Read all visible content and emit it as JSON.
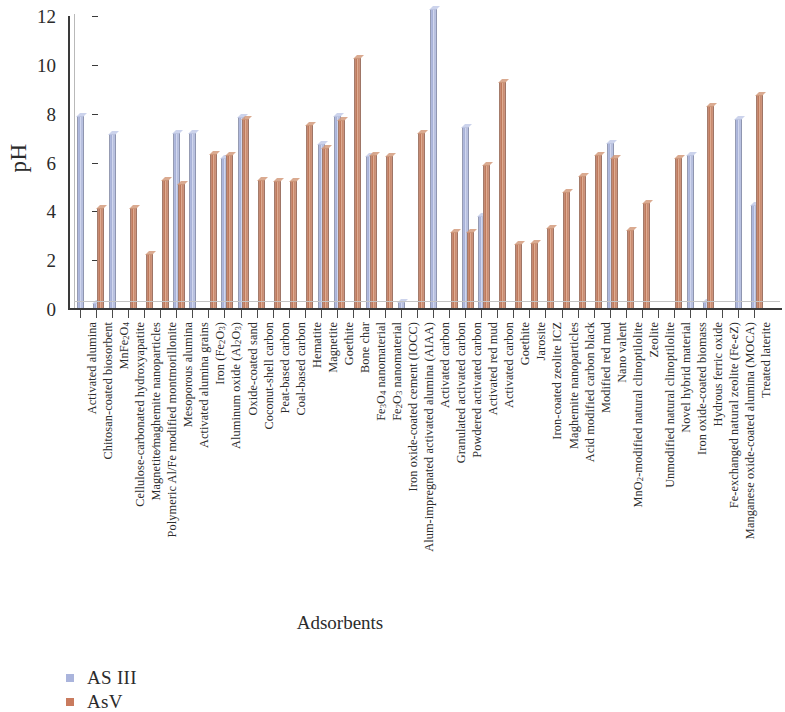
{
  "chart_data": {
    "type": "bar",
    "title": "",
    "xlabel": "Adsorbents",
    "ylabel": "pH",
    "ylim": [
      0,
      12
    ],
    "yticks": [
      0,
      2,
      4,
      6,
      8,
      10,
      12
    ],
    "grid": false,
    "legend_position": "bottom-left",
    "categories": [
      "Activated alumina",
      "Chitosan-coated biosorbent",
      "MnFe₂O₄",
      "Cellulose-carbonated hydroxyapatite",
      "Magnetite⁄maghemite nanoparticles",
      "Polymeric Al/Fe modified montmorillonite",
      "Mesoporous alumina",
      "Activated alumina grains",
      "Iron (Fe₂O₃)",
      "Aluminum oxide (Al₂O₃)",
      "Oxide-coated sand",
      "Coconut-shell carbon",
      "Peat-based carbon",
      "Coal-based carbon",
      "Hematite",
      "Magnetite",
      "Goethite",
      "Bone char",
      "Fe₃O₄ nanomaterial",
      "Fe₂O₃ nanomaterial",
      "Iron oxide-coated cement (IOCC)",
      "Alum-impregnated activated alumina (AIAA)",
      "Activated carbon",
      "Granulated activated carbon",
      "Powdered activated carbon",
      "Activated red mud",
      "Activated carbon",
      "Goethite",
      "Jarosite",
      "Iron-coated zeolite ICZ",
      "Maghemite nanoparticles",
      "Acid modified carbon black",
      "Modified red mud",
      "Nano valent",
      "MnO₂-modified natural clinoptilolite",
      "Zeolite",
      "Unmodified natural clinoptilolite",
      "Novel hybrid material",
      "Iron oxide-coated biomass",
      "Hydrous ferric oxide",
      "Fe-exchanged natural zeolite (Fe-eZ)",
      "Manganese oxide-coated alumina (MOCA)",
      "Treated laterite"
    ],
    "series": [
      {
        "name": "AS III",
        "color": "#aab4dc",
        "values": [
          7.9,
          0.25,
          7.15,
          0,
          0,
          0,
          7.2,
          7.2,
          0,
          6.2,
          7.85,
          0,
          0,
          0,
          0,
          6.75,
          7.9,
          0,
          6.25,
          0,
          0.3,
          0,
          12.3,
          0,
          7.45,
          3.8,
          0,
          0,
          0,
          0,
          0,
          0,
          0,
          6.8,
          0,
          0,
          0,
          0,
          6.3,
          0.3,
          0,
          7.8,
          4.25
        ]
      },
      {
        "name": "AsV",
        "color": "#c97b5e",
        "values": [
          0,
          4.15,
          0,
          4.15,
          2.25,
          5.3,
          5.1,
          0,
          6.35,
          6.3,
          7.8,
          5.3,
          5.25,
          5.25,
          7.55,
          6.6,
          7.75,
          10.3,
          6.3,
          6.25,
          0,
          7.2,
          0,
          3.15,
          3.15,
          5.9,
          9.3,
          2.65,
          2.7,
          3.3,
          4.8,
          5.45,
          6.3,
          6.2,
          3.25,
          4.35,
          0,
          6.2,
          0,
          8.3,
          0,
          0,
          8.75
        ]
      }
    ]
  },
  "legend": {
    "items": [
      {
        "label": "AS III",
        "color": "#aab4dc"
      },
      {
        "label": "AsV",
        "color": "#c97b5e"
      }
    ]
  },
  "axes": {
    "y_title": "pH",
    "x_title": "Adsorbents"
  }
}
